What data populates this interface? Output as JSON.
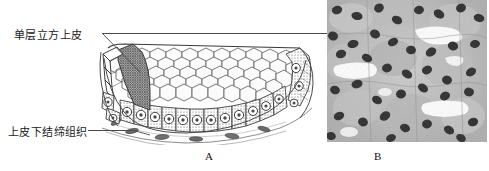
{
  "figure": {
    "background_color": "#ffffff",
    "line_color": "#4a4a4a",
    "ink_color": "#1a1a1a"
  },
  "labels": {
    "epithelium": "单层立方上皮",
    "connective_tissue": "上皮下结缔组织"
  },
  "panels": [
    {
      "id": "A",
      "letter": "A",
      "type": "line-drawing",
      "description": "简单立方上皮组织线条图，示上皮细胞表面观与切面观"
    },
    {
      "id": "B",
      "letter": "B",
      "type": "photomicrograph",
      "description": "单层立方上皮光学显微镜照片，灰度染色切片"
    }
  ],
  "leaders": {
    "epithelium_target": "panel-b",
    "connective_target": "panel-a-basal-tissue"
  },
  "icons": {
    "epithelium_leader": "leader-line-icon",
    "connective_leader": "leader-line-icon"
  }
}
